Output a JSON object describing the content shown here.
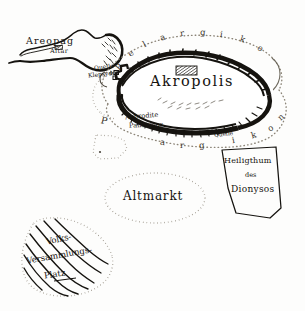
{
  "map": {
    "title": "Akropolis von Athen",
    "ink_color": "#15130f",
    "dotted_color": "#8c8578",
    "paper_color": "#fdfdfc",
    "features": {
      "akropolis": {
        "label": "Akropolis",
        "type": "plateau",
        "temple_marker": "hatched-rectangle"
      },
      "areopag": {
        "label": "Areopag",
        "sublabel": "Altar",
        "type": "hill"
      },
      "altmarkt": {
        "label": "Altmarkt",
        "type": "dotted-oval-enclosure"
      },
      "heiligthum": {
        "line1": "Heiligthum",
        "line2": "des",
        "line3": "Dionysos",
        "type": "sanctuary-polygon"
      },
      "pnyx": {
        "line1": "Volks-",
        "line2": "Versammlungs-",
        "line3": "Platz",
        "type": "hachured-slope"
      },
      "klepsydra": {
        "line1": "Quelle",
        "line2": "Klepsydra",
        "type": "spring"
      },
      "aphrodite": {
        "line1": "Aphrodite",
        "line2": "Pandemos",
        "type": "shrine"
      },
      "quelle_south": {
        "label": "Quelle",
        "type": "spring"
      }
    },
    "pelargikon": {
      "name": "Pelargikon",
      "upper_letters": [
        "P",
        "e",
        "l",
        "a",
        "r",
        "g",
        "i",
        "k",
        "o"
      ],
      "lower_letters": [
        "P",
        "a",
        "r",
        "g",
        "i",
        "k",
        "o",
        "n"
      ],
      "style": "dotted-ring-wall"
    }
  }
}
